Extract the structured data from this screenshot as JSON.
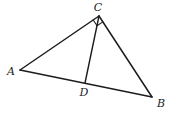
{
  "figure": {
    "background_color": "#ffffff",
    "stroke_color": "#1c1c1c",
    "points": {
      "A": {
        "x": 20,
        "y": 70
      },
      "B": {
        "x": 152,
        "y": 97
      },
      "C": {
        "x": 99,
        "y": 16
      },
      "D": {
        "x": 85,
        "y": 83
      }
    },
    "segments": [
      {
        "id": "edge-AC",
        "from": "A",
        "to": "C",
        "kind": "edge"
      },
      {
        "id": "edge-AB",
        "from": "A",
        "to": "B",
        "kind": "edge"
      },
      {
        "id": "edge-CB",
        "from": "C",
        "to": "B",
        "kind": "edge"
      },
      {
        "id": "cevian-CD",
        "from": "C",
        "to": "D",
        "kind": "cevian"
      }
    ],
    "right_angle_marker": {
      "vertex": "C",
      "between": [
        "A",
        "B"
      ],
      "size": 7
    },
    "labels": [
      {
        "id": "A",
        "text": "A",
        "x": 11,
        "y": 75,
        "anchor": "middle"
      },
      {
        "id": "B",
        "text": "B",
        "x": 161,
        "y": 107,
        "anchor": "middle"
      },
      {
        "id": "C",
        "text": "C",
        "x": 98,
        "y": 11,
        "anchor": "middle"
      },
      {
        "id": "D",
        "text": "D",
        "x": 84,
        "y": 96,
        "anchor": "middle"
      }
    ]
  }
}
